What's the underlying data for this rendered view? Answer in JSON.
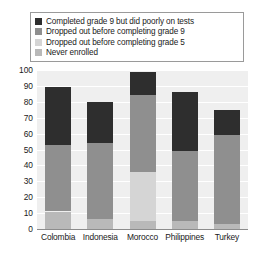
{
  "chart_data": {
    "type": "bar",
    "subtype": "stacked-bar",
    "title": "",
    "xlabel": "",
    "ylabel": "",
    "ylim": [
      0,
      100
    ],
    "yticks": [
      0,
      10,
      20,
      30,
      40,
      50,
      60,
      70,
      80,
      90,
      100
    ],
    "grid": true,
    "legend_position": "top",
    "categories": [
      "Colombia",
      "Indonesia",
      "Morocco",
      "Philippines",
      "Turkey"
    ],
    "series": [
      {
        "name": "Never enrolled",
        "color": "#b9b9b9",
        "values": [
          11,
          6,
          5,
          5,
          3
        ]
      },
      {
        "name": "Dropped out before completing grade 5",
        "color": "#d5d5d5",
        "values": [
          0,
          0,
          31,
          0,
          0
        ]
      },
      {
        "name": "Dropped out before completing grade 9",
        "color": "#8f8f8f",
        "values": [
          42,
          48,
          48,
          44,
          56
        ]
      },
      {
        "name": "Completed grade 9 but did poorly on tests",
        "color": "#2e2e2e",
        "values": [
          36,
          26,
          15,
          37,
          16
        ]
      }
    ],
    "stack_order_bottom_to_top": [
      "Never enrolled",
      "Dropped out before completing grade 5",
      "Dropped out before completing grade 9",
      "Completed grade 9 but did poorly on tests"
    ],
    "totals": [
      89,
      80,
      99,
      86,
      75
    ]
  },
  "legend": {
    "items": [
      {
        "label": "Completed grade 9 but did poorly on tests",
        "color": "#2e2e2e",
        "swatch_name": "legend-swatch-completed-grade-9"
      },
      {
        "label": "Dropped out before completing grade 9",
        "color": "#8f8f8f",
        "swatch_name": "legend-swatch-dropped-before-grade-9"
      },
      {
        "label": "Dropped out before completing grade 5",
        "color": "#d5d5d5",
        "swatch_name": "legend-swatch-dropped-before-grade-5"
      },
      {
        "label": "Never enrolled",
        "color": "#b9b9b9",
        "swatch_name": "legend-swatch-never-enrolled"
      }
    ]
  },
  "colors": {
    "plot_background": "#efefef",
    "gridline": "#ffffff",
    "axis": "#8c8c8c",
    "text": "#1a1a1a",
    "legend_border": "#9a9a9a"
  }
}
